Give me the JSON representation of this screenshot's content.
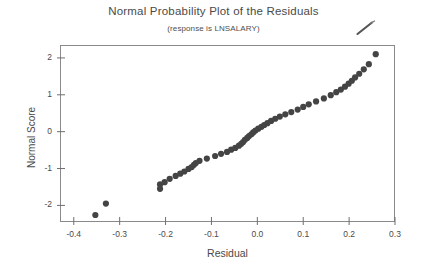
{
  "chart_data": {
    "type": "scatter",
    "title": "Normal Probability Plot of the Residuals",
    "subtitle": "(response is LNSALARY)",
    "xlabel": "Residual",
    "ylabel": "Normal Score",
    "xlim": [
      -0.43,
      0.3
    ],
    "ylim": [
      -2.45,
      2.35
    ],
    "xticks": [
      -0.4,
      -0.3,
      -0.2,
      -0.1,
      0.0,
      0.1,
      0.2,
      0.3
    ],
    "xtick_labels": [
      "-0.4",
      "-0.3",
      "-0.2",
      "-0.1",
      "0.0",
      "0.1",
      "0.2",
      "0.3"
    ],
    "yticks": [
      -2,
      -1,
      0,
      1,
      2
    ],
    "ytick_labels": [
      "-2",
      "-1",
      "0",
      "1",
      "2"
    ],
    "grid": false,
    "legend": false,
    "marker": "filled-circle",
    "marker_color": "#444444",
    "marker_size": 3.1,
    "points": [
      {
        "x": -0.353,
        "y": -2.26
      },
      {
        "x": -0.33,
        "y": -1.95
      },
      {
        "x": -0.212,
        "y": -1.55
      },
      {
        "x": -0.212,
        "y": -1.43
      },
      {
        "x": -0.202,
        "y": -1.37
      },
      {
        "x": -0.191,
        "y": -1.28
      },
      {
        "x": -0.178,
        "y": -1.2
      },
      {
        "x": -0.168,
        "y": -1.14
      },
      {
        "x": -0.159,
        "y": -1.08
      },
      {
        "x": -0.15,
        "y": -1.01
      },
      {
        "x": -0.143,
        "y": -0.96
      },
      {
        "x": -0.138,
        "y": -0.9
      },
      {
        "x": -0.134,
        "y": -0.85
      },
      {
        "x": -0.126,
        "y": -0.79
      },
      {
        "x": -0.11,
        "y": -0.73
      },
      {
        "x": -0.092,
        "y": -0.66
      },
      {
        "x": -0.079,
        "y": -0.6
      },
      {
        "x": -0.066,
        "y": -0.55
      },
      {
        "x": -0.057,
        "y": -0.49
      },
      {
        "x": -0.048,
        "y": -0.44
      },
      {
        "x": -0.04,
        "y": -0.38
      },
      {
        "x": -0.035,
        "y": -0.33
      },
      {
        "x": -0.031,
        "y": -0.28
      },
      {
        "x": -0.027,
        "y": -0.22
      },
      {
        "x": -0.022,
        "y": -0.17
      },
      {
        "x": -0.018,
        "y": -0.12
      },
      {
        "x": -0.013,
        "y": -0.07
      },
      {
        "x": -0.009,
        "y": -0.02
      },
      {
        "x": -0.004,
        "y": 0.03
      },
      {
        "x": 0.002,
        "y": 0.08
      },
      {
        "x": 0.009,
        "y": 0.13
      },
      {
        "x": 0.015,
        "y": 0.18
      },
      {
        "x": 0.022,
        "y": 0.23
      },
      {
        "x": 0.03,
        "y": 0.29
      },
      {
        "x": 0.039,
        "y": 0.35
      },
      {
        "x": 0.049,
        "y": 0.41
      },
      {
        "x": 0.061,
        "y": 0.47
      },
      {
        "x": 0.074,
        "y": 0.53
      },
      {
        "x": 0.088,
        "y": 0.6
      },
      {
        "x": 0.1,
        "y": 0.67
      },
      {
        "x": 0.112,
        "y": 0.74
      },
      {
        "x": 0.128,
        "y": 0.82
      },
      {
        "x": 0.145,
        "y": 0.9
      },
      {
        "x": 0.16,
        "y": 0.99
      },
      {
        "x": 0.172,
        "y": 1.07
      },
      {
        "x": 0.182,
        "y": 1.14
      },
      {
        "x": 0.191,
        "y": 1.22
      },
      {
        "x": 0.199,
        "y": 1.3
      },
      {
        "x": 0.206,
        "y": 1.38
      },
      {
        "x": 0.213,
        "y": 1.47
      },
      {
        "x": 0.222,
        "y": 1.57
      },
      {
        "x": 0.232,
        "y": 1.69
      },
      {
        "x": 0.243,
        "y": 1.83
      },
      {
        "x": 0.258,
        "y": 2.1
      }
    ]
  },
  "annotations": {
    "pen_mark_name": "handwritten-pen-stroke"
  },
  "axes": {
    "frame_color": "#8a8a8a",
    "tick_color": "#6f6f6f"
  }
}
